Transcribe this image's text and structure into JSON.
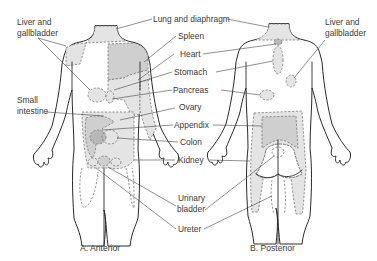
{
  "diagram": {
    "labels": {
      "liver_gallbladder_left": [
        "Liver and",
        "gallbladder"
      ],
      "liver_gallbladder_right": [
        "Liver and",
        "gallbladder"
      ],
      "lung_diaphragm": "Lung and diaphragm",
      "spleen": "Spleen",
      "heart": "Heart",
      "stomach": "Stomach",
      "pancreas": "Pancreas",
      "small_intestine": [
        "Small",
        "intestine"
      ],
      "ovary": "Ovary",
      "appendix": "Appendix",
      "colon": "Colon",
      "kidney": "Kidney",
      "urinary_bladder": [
        "Urinary",
        "bladder"
      ],
      "ureter": "Ureter"
    },
    "captions": {
      "anterior": "A. Anterior",
      "posterior": "B. Posterior"
    },
    "colors": {
      "light_zone": "#e4e4e4",
      "medium_zone": "#cfcfcf",
      "dark_zone": "#b8b8b8",
      "outline": "#2a2a2a",
      "text": "#3a3a3a"
    }
  }
}
